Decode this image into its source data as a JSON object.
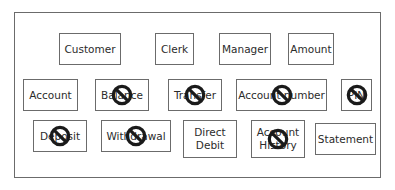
{
  "diagram": {
    "row1": [
      {
        "id": "customer",
        "label": "Customer",
        "excluded": false
      },
      {
        "id": "clerk",
        "label": "Clerk",
        "excluded": false
      },
      {
        "id": "manager",
        "label": "Manager",
        "excluded": false
      },
      {
        "id": "amount",
        "label": "Amount",
        "excluded": false
      }
    ],
    "row2": [
      {
        "id": "account",
        "label": "Account",
        "excluded": false
      },
      {
        "id": "balance",
        "label": "Balance",
        "excluded": true
      },
      {
        "id": "transfer",
        "label": "Transfer",
        "excluded": true
      },
      {
        "id": "account-number",
        "label": "Account number",
        "excluded": true
      },
      {
        "id": "pin",
        "label": "PIN",
        "excluded": true
      }
    ],
    "row3": [
      {
        "id": "deposit",
        "label": "Deposit",
        "excluded": true
      },
      {
        "id": "withdrawal",
        "label": "Withdrawal",
        "excluded": true
      },
      {
        "id": "direct-debit",
        "label": "Direct\nDebit",
        "excluded": false
      },
      {
        "id": "account-history",
        "label": "Account\nHistory",
        "excluded": true
      },
      {
        "id": "statement",
        "label": "Statement",
        "excluded": false
      }
    ]
  },
  "colors": {
    "border": "#6b6b6b",
    "prohibit": "#1a1a1a",
    "text": "#2b2b2b"
  }
}
